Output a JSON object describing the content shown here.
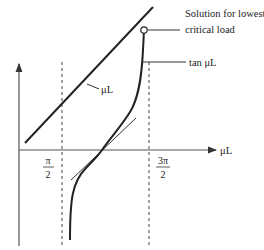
{
  "diagram": {
    "axes": {
      "x_label": "μL",
      "x_ticks": [
        {
          "num": "π",
          "den": "2"
        },
        {
          "num": "3π",
          "den": "2"
        }
      ]
    },
    "curves": {
      "line_label": "μL",
      "tan_label": "tan μL"
    },
    "annotation": {
      "line1": "Solution for lowest",
      "line2": "critical load"
    },
    "colors": {
      "ink": "#222222",
      "axis": "#555555"
    }
  }
}
